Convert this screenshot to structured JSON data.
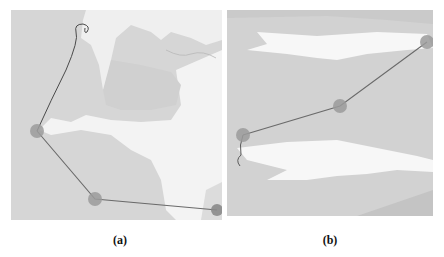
{
  "figure": {
    "panels": [
      {
        "id": "a",
        "caption": "(a)",
        "colors": {
          "water": "#d4d4d4",
          "land": "#f2f2f2",
          "route": "#6a6a6a",
          "waypoint": "#9a9a9a"
        },
        "waypoints": [
          {
            "x": 26,
            "y": 121
          },
          {
            "x": 84,
            "y": 189
          },
          {
            "x": 206,
            "y": 200
          }
        ]
      },
      {
        "id": "b",
        "caption": "(b)",
        "colors": {
          "water": "#cfcfcf",
          "land": "#f4f4f4",
          "route": "#6a6a6a",
          "waypoint": "#9a9a9a"
        },
        "waypoints": [
          {
            "x": 200,
            "y": 32
          },
          {
            "x": 113,
            "y": 96
          },
          {
            "x": 16,
            "y": 125
          }
        ]
      }
    ]
  }
}
